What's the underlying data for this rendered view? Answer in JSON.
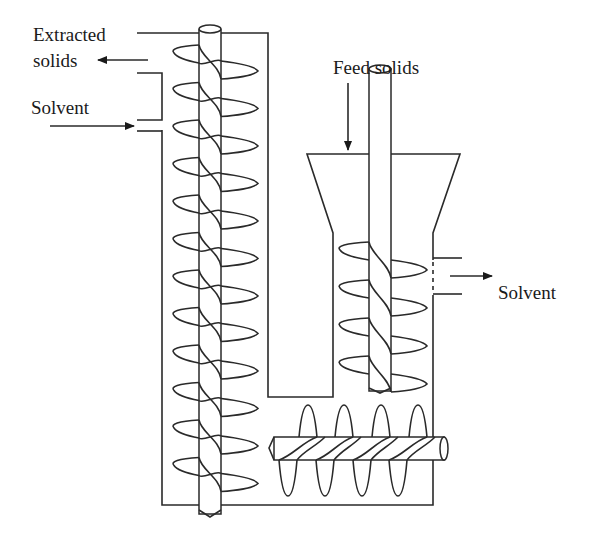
{
  "figure": {
    "type": "process-schematic"
  },
  "labels": {
    "extracted_solids_line1": "Extracted",
    "extracted_solids_line2": "solids",
    "solvent_in": "Solvent",
    "feed_solids": "Feed solids",
    "solvent_out": "Solvent"
  },
  "components": [
    {
      "id": "vertical-screw-conveyor",
      "orientation": "vertical",
      "position": "left"
    },
    {
      "id": "feed-hopper",
      "position": "top-right"
    },
    {
      "id": "feed-screw-conveyor",
      "orientation": "vertical",
      "position": "right"
    },
    {
      "id": "horizontal-screw-conveyor",
      "orientation": "horizontal",
      "position": "bottom"
    },
    {
      "id": "solvent-outlet-screen",
      "position": "right-wall"
    }
  ],
  "flows": [
    {
      "name": "Feed solids",
      "direction": "down",
      "into": "feed-hopper"
    },
    {
      "name": "Solvent",
      "direction": "in",
      "side": "left-top"
    },
    {
      "name": "Extracted solids",
      "direction": "out",
      "side": "left-top"
    },
    {
      "name": "Solvent",
      "direction": "out",
      "side": "right"
    }
  ],
  "colors": {
    "line": "#2a2a2a",
    "background": "#ffffff"
  }
}
